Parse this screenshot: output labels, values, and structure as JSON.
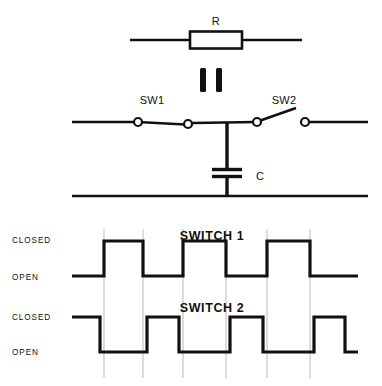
{
  "figure": {
    "background_color": "#ffffff",
    "line_color": "#111111",
    "gridline_color": "#b9b9b9"
  },
  "circuit": {
    "resistor": {
      "label": "R",
      "type": "resistor-symbol"
    },
    "equivalence": {
      "symbol": "||",
      "meaning": "equals-sign-rotated",
      "bar_count": 2
    },
    "switch_1": {
      "label": "SW1",
      "state": "closed",
      "terminal_count": 2
    },
    "switch_2": {
      "label": "SW2",
      "state": "open",
      "terminal_count": 2
    },
    "capacitor": {
      "label": "C",
      "type": "capacitor-symbol",
      "plate_count": 2
    },
    "ground_rail": {
      "label": ""
    }
  },
  "timing": {
    "charts": [
      {
        "title": "SWITCH 1",
        "level_labels": {
          "high": "CLOSED",
          "low": "OPEN"
        },
        "initial_state": "OPEN"
      },
      {
        "title": "SWITCH 2",
        "level_labels": {
          "high": "CLOSED",
          "low": "OPEN"
        },
        "initial_state": "CLOSED"
      }
    ]
  },
  "chart_data": [
    {
      "type": "line",
      "title": "SWITCH 1",
      "xlabel": "",
      "ylabel": "",
      "ylim": [
        0,
        1
      ],
      "xlim": [
        72,
        358
      ],
      "grid": true,
      "gridlines_x": [
        104,
        143,
        183,
        226,
        267,
        310
      ],
      "legend": "none",
      "ytick_labels": [
        "OPEN",
        "CLOSED"
      ],
      "ytick_values": [
        0,
        1
      ],
      "waveform": "digital-square",
      "description": "Non-overlapping clock phase 1; low (OPEN) at start, three CLOSED pulses.",
      "transitions": [
        {
          "x": 72,
          "level": 0
        },
        {
          "x": 104,
          "level": 1
        },
        {
          "x": 143,
          "level": 0
        },
        {
          "x": 183,
          "level": 1
        },
        {
          "x": 226,
          "level": 0
        },
        {
          "x": 267,
          "level": 1
        },
        {
          "x": 310,
          "level": 0
        },
        {
          "x": 358,
          "level": 0
        }
      ]
    },
    {
      "type": "line",
      "title": "SWITCH 2",
      "xlabel": "",
      "ylabel": "",
      "ylim": [
        0,
        1
      ],
      "xlim": [
        72,
        358
      ],
      "grid": true,
      "gridlines_x": [
        104,
        143,
        183,
        226,
        267,
        310
      ],
      "legend": "none",
      "ytick_labels": [
        "OPEN",
        "CLOSED"
      ],
      "ytick_values": [
        0,
        1
      ],
      "waveform": "digital-square",
      "description": "Non-overlapping clock phase 2; complement of SWITCH 1, high (CLOSED) at start.",
      "transitions": [
        {
          "x": 72,
          "level": 1
        },
        {
          "x": 100,
          "level": 0
        },
        {
          "x": 147,
          "level": 1
        },
        {
          "x": 179,
          "level": 0
        },
        {
          "x": 230,
          "level": 1
        },
        {
          "x": 263,
          "level": 0
        },
        {
          "x": 314,
          "level": 1
        },
        {
          "x": 345,
          "level": 0
        },
        {
          "x": 358,
          "level": 0
        }
      ]
    }
  ]
}
